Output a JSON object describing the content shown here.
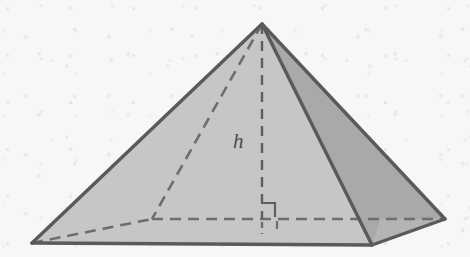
{
  "figure": {
    "kind": "geometric-solid-diagram",
    "labels": {
      "height": "h"
    },
    "colors": {
      "background": "#f7f7f5",
      "front_left_face": "#c7c7c7",
      "front_right_face": "#bcbcbc",
      "right_side_face": "#a8a8a8",
      "outline": "#5a5a5a",
      "hidden_edge": "#6b6b6b",
      "label_text": "#4a4a4a"
    },
    "geometry": {
      "apex": [
        262,
        24
      ],
      "base_front_left": [
        32,
        243
      ],
      "base_front_right": [
        372,
        245
      ],
      "base_back_right": [
        445,
        219
      ],
      "base_back_left": [
        152,
        219
      ],
      "base_center": [
        262,
        219
      ],
      "height_line": [
        [
          262,
          24
        ],
        [
          262,
          219
        ]
      ]
    },
    "annotations": {
      "right_angle_marker": "right-angle at base center between height and base diagonal",
      "height_line_style": "dashed",
      "hidden_edges_style": "dashed"
    }
  }
}
